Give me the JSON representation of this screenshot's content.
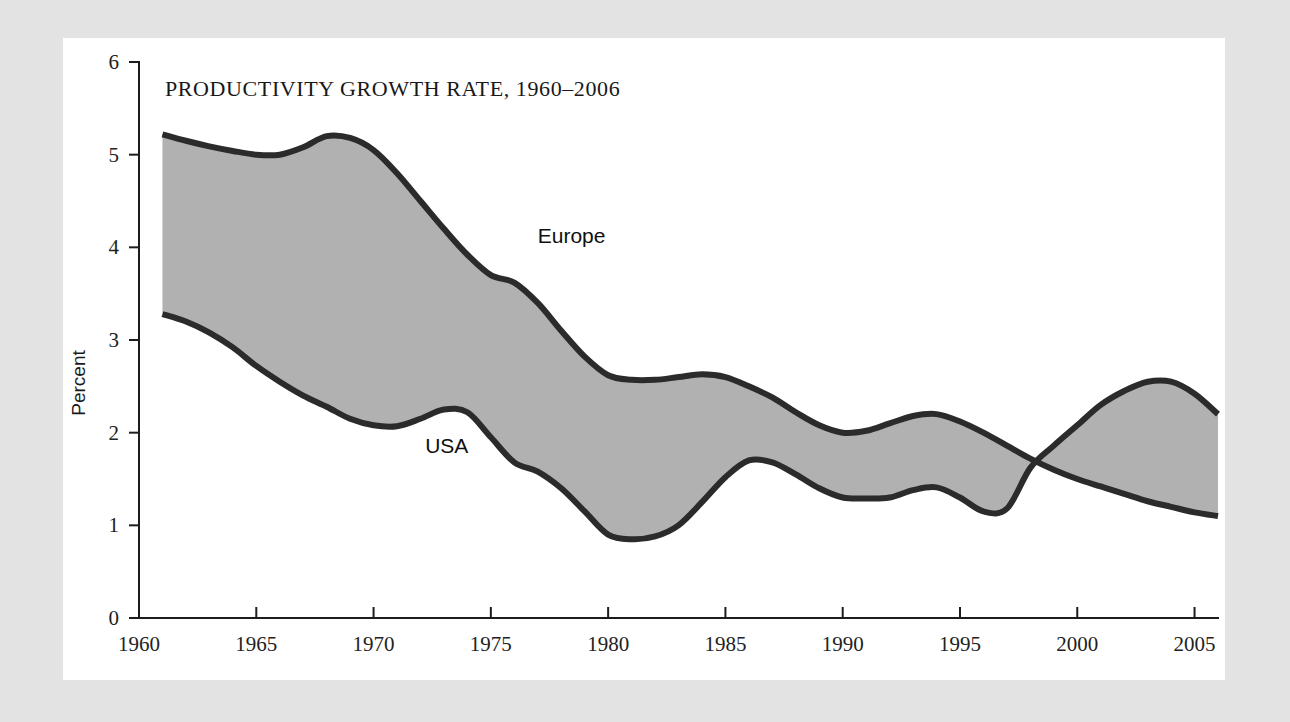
{
  "figure": {
    "title": "PRODUCTIVITY GROWTH RATE, 1960–2006",
    "y_axis_title": "Percent",
    "background_color": "#e3e3e3",
    "card_color": "#ffffff",
    "band_fill_color": "#b1b1b1",
    "line_color": "#2b2b2b"
  },
  "labels": {
    "europe": "Europe",
    "usa": "USA"
  },
  "axes": {
    "y_ticks": [
      "0",
      "1",
      "2",
      "3",
      "4",
      "5",
      "6"
    ],
    "x_ticks": [
      "1960",
      "1965",
      "1970",
      "1975",
      "1980",
      "1985",
      "1990",
      "1995",
      "2000",
      "2005"
    ]
  },
  "chart_data": {
    "type": "line",
    "title": "PRODUCTIVITY GROWTH RATE, 1960–2006",
    "xlabel": "",
    "ylabel": "Percent",
    "xlim": [
      1960,
      2006
    ],
    "ylim": [
      0,
      6
    ],
    "grid": false,
    "legend": "inline-annotations",
    "x": [
      1961,
      1962,
      1963,
      1964,
      1965,
      1966,
      1967,
      1968,
      1969,
      1970,
      1971,
      1972,
      1973,
      1974,
      1975,
      1976,
      1977,
      1978,
      1979,
      1980,
      1981,
      1982,
      1983,
      1984,
      1985,
      1986,
      1987,
      1988,
      1989,
      1990,
      1991,
      1992,
      1993,
      1994,
      1995,
      1996,
      1997,
      1998,
      1999,
      2000,
      2001,
      2002,
      2003,
      2004,
      2005,
      2006
    ],
    "series": [
      {
        "name": "Europe",
        "values": [
          5.22,
          5.15,
          5.09,
          5.04,
          5.0,
          5.0,
          5.08,
          5.2,
          5.18,
          5.05,
          4.8,
          4.5,
          4.2,
          3.92,
          3.7,
          3.62,
          3.4,
          3.1,
          2.82,
          2.62,
          2.57,
          2.57,
          2.6,
          2.63,
          2.6,
          2.5,
          2.38,
          2.22,
          2.08,
          2.0,
          2.02,
          2.1,
          2.18,
          2.2,
          2.12,
          2.0,
          1.86,
          1.72,
          1.6,
          1.5,
          1.42,
          1.34,
          1.26,
          1.2,
          1.14,
          1.1
        ]
      },
      {
        "name": "USA",
        "values": [
          3.28,
          3.2,
          3.08,
          2.92,
          2.72,
          2.55,
          2.4,
          2.28,
          2.15,
          2.08,
          2.07,
          2.15,
          2.25,
          2.22,
          1.95,
          1.68,
          1.58,
          1.4,
          1.15,
          0.9,
          0.85,
          0.88,
          1.0,
          1.25,
          1.52,
          1.7,
          1.68,
          1.55,
          1.4,
          1.3,
          1.29,
          1.3,
          1.38,
          1.41,
          1.3,
          1.15,
          1.18,
          1.62,
          1.86,
          2.08,
          2.3,
          2.45,
          2.55,
          2.55,
          2.42,
          2.2
        ]
      }
    ],
    "annotations": [
      {
        "text": "Europe",
        "x": 1977,
        "y": 4.05
      },
      {
        "text": "USA",
        "x": 1972.2,
        "y": 1.78
      }
    ]
  }
}
